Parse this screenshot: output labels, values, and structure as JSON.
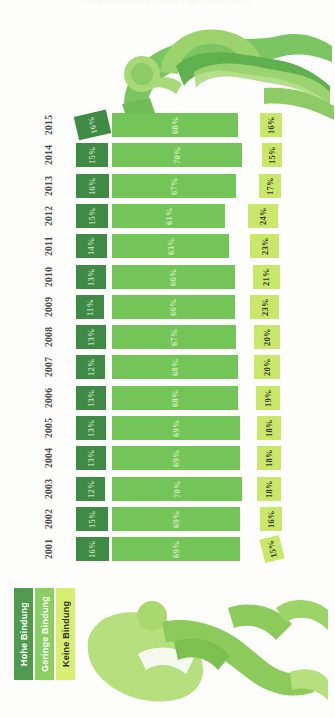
{
  "title": "Mitarbeiterbindung (Gallup Engagement Index)",
  "legend": {
    "items": [
      {
        "label": "Hohe Bindung",
        "color": "#4f9a4f",
        "key": "hohe"
      },
      {
        "label": "Geringe Bindung",
        "color": "#8bcf62",
        "key": "geringe"
      },
      {
        "label": "Keine Bindung",
        "color": "#d6ef72",
        "key": "keine"
      }
    ]
  },
  "chart_data": {
    "type": "bar",
    "title": "Mitarbeiterbindung (Gallup Engagement Index)",
    "xlabel": "",
    "ylabel": "",
    "orientation": "horizontal",
    "stacked": false,
    "grid": false,
    "legend_position": "bottom-left",
    "categories": [
      "2015",
      "2014",
      "2013",
      "2012",
      "2011",
      "2010",
      "2009",
      "2008",
      "2007",
      "2006",
      "2005",
      "2004",
      "2003",
      "2002",
      "2001"
    ],
    "series": [
      {
        "name": "Hohe Bindung",
        "color": "#3f8b45",
        "values": [
          16,
          15,
          16,
          15,
          14,
          13,
          11,
          13,
          12,
          13,
          13,
          13,
          12,
          15,
          16
        ]
      },
      {
        "name": "Geringe Bindung",
        "color": "#74c557",
        "values": [
          68,
          70,
          67,
          61,
          63,
          66,
          66,
          67,
          68,
          68,
          69,
          69,
          70,
          69,
          69
        ]
      },
      {
        "name": "Keine Bindung",
        "color": "#c9e86a",
        "values": [
          16,
          15,
          17,
          24,
          23,
          21,
          23,
          20,
          20,
          19,
          18,
          18,
          18,
          16,
          15
        ]
      }
    ],
    "unit": "%",
    "ylim": [
      0,
      100
    ]
  },
  "rows": [
    {
      "year": "2015",
      "hohe": "16%",
      "geringe": "68%",
      "keine": "16%"
    },
    {
      "year": "2014",
      "hohe": "15%",
      "geringe": "70%",
      "keine": "15%"
    },
    {
      "year": "2013",
      "hohe": "16%",
      "geringe": "67%",
      "keine": "17%"
    },
    {
      "year": "2012",
      "hohe": "15%",
      "geringe": "61%",
      "keine": "24%"
    },
    {
      "year": "2011",
      "hohe": "14%",
      "geringe": "63%",
      "keine": "23%"
    },
    {
      "year": "2010",
      "hohe": "13%",
      "geringe": "66%",
      "keine": "21%"
    },
    {
      "year": "2009",
      "hohe": "11%",
      "geringe": "66%",
      "keine": "23%"
    },
    {
      "year": "2008",
      "hohe": "13%",
      "geringe": "67%",
      "keine": "20%"
    },
    {
      "year": "2007",
      "hohe": "12%",
      "geringe": "68%",
      "keine": "20%"
    },
    {
      "year": "2006",
      "hohe": "13%",
      "geringe": "68%",
      "keine": "19%"
    },
    {
      "year": "2005",
      "hohe": "13%",
      "geringe": "69%",
      "keine": "18%"
    },
    {
      "year": "2004",
      "hohe": "13%",
      "geringe": "69%",
      "keine": "18%"
    },
    {
      "year": "2003",
      "hohe": "12%",
      "geringe": "70%",
      "keine": "18%"
    },
    {
      "year": "2002",
      "hohe": "15%",
      "geringe": "69%",
      "keine": "16%"
    },
    {
      "year": "2001",
      "hohe": "16%",
      "geringe": "69%",
      "keine": "15%"
    }
  ],
  "decorations": {
    "runner_top": "runner-figure-icon",
    "runner_bottom_1": "runner-figure-icon",
    "runner_bottom_2": "runner-figure-icon"
  }
}
